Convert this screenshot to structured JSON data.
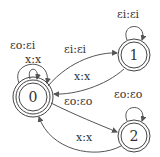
{
  "diagram": {
    "type": "finite-state-transducer",
    "colors": {
      "stroke": "#444444",
      "text": "#333333",
      "background": "#ffffff"
    },
    "states": [
      {
        "id": "0",
        "label": "0",
        "initial": true,
        "accepting": true
      },
      {
        "id": "1",
        "label": "1",
        "accepting": true
      },
      {
        "id": "2",
        "label": "2",
        "accepting": true
      }
    ],
    "transitions": [
      {
        "from": "0",
        "to": "0",
        "label": "x:x"
      },
      {
        "from": "0",
        "to": "0",
        "label": "εo:εi"
      },
      {
        "from": "0",
        "to": "1",
        "label": "εi:εi"
      },
      {
        "from": "1",
        "to": "0",
        "label": "x:x"
      },
      {
        "from": "1",
        "to": "1",
        "label": "εi:εi"
      },
      {
        "from": "0",
        "to": "2",
        "label": "εo:εo"
      },
      {
        "from": "2",
        "to": "0",
        "label": "x:x"
      },
      {
        "from": "2",
        "to": "2",
        "label": "εo:εo"
      }
    ]
  }
}
